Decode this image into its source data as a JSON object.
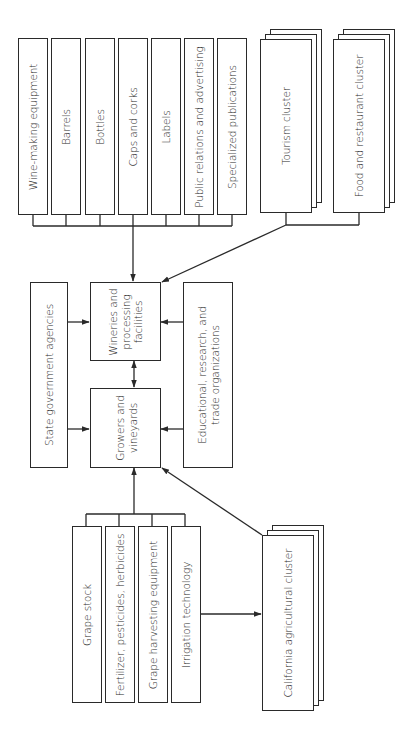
{
  "diagram": {
    "type": "cluster-map",
    "orientation": "rotated-90-ccw",
    "colors": {
      "stroke": "#2a2a2a",
      "background": "#ffffff",
      "text": "#2a2a2a"
    },
    "supplier_boxes_top": [
      {
        "id": "wine-making-equipment",
        "label": "Wine-making equipment"
      },
      {
        "id": "barrels",
        "label": "Barrels"
      },
      {
        "id": "bottles",
        "label": "Bottles"
      },
      {
        "id": "caps-and-corks",
        "label": "Caps and corks"
      },
      {
        "id": "labels",
        "label": "Labels"
      },
      {
        "id": "public-relations",
        "label": "Public relations and advertising"
      },
      {
        "id": "specialized-publications",
        "label": "Specialized publications"
      }
    ],
    "related_clusters_top": [
      {
        "id": "tourism-cluster",
        "label": "Tourism cluster"
      },
      {
        "id": "food-restaurant-cluster",
        "label": "Food and restaurant cluster"
      }
    ],
    "core": {
      "state_government": {
        "label": "State government agencies"
      },
      "wineries": {
        "line1": "Wineries and",
        "line2": "processing",
        "line3": "facilities"
      },
      "growers": {
        "line1": "Growers and",
        "line2": "vineyards"
      },
      "educational": {
        "line1": "Educational, research, and",
        "line2": "trade organizations"
      }
    },
    "supplier_boxes_bottom": [
      {
        "id": "grape-stock",
        "label": "Grape stock"
      },
      {
        "id": "fertilizer",
        "label": "Fertilizer, pesticides, herbicides"
      },
      {
        "id": "grape-harvesting",
        "label": "Grape harvesting equipment"
      },
      {
        "id": "irrigation",
        "label": "Irrigation technology"
      }
    ],
    "related_clusters_bottom": [
      {
        "id": "california-agricultural-cluster",
        "label": "California agricultural cluster"
      }
    ],
    "connections": [
      {
        "from": "top suppliers",
        "to": "Wineries and processing facilities",
        "type": "arrow"
      },
      {
        "from": "Tourism / Food and restaurant clusters",
        "to": "Wineries and processing facilities",
        "type": "arrow"
      },
      {
        "from": "State government agencies",
        "to": "Wineries and processing facilities",
        "type": "arrow"
      },
      {
        "from": "State government agencies",
        "to": "Growers and vineyards",
        "type": "arrow"
      },
      {
        "from": "Educational, research, and trade organizations",
        "to": "Wineries and processing facilities",
        "type": "arrow"
      },
      {
        "from": "Educational, research, and trade organizations",
        "to": "Growers and vineyards",
        "type": "arrow"
      },
      {
        "from": "Wineries and processing facilities",
        "to": "Growers and vineyards",
        "type": "bidirectional"
      },
      {
        "from": "bottom suppliers",
        "to": "Growers and vineyards",
        "type": "arrow"
      },
      {
        "from": "California agricultural cluster",
        "to": "Growers and vineyards",
        "type": "arrow"
      },
      {
        "from": "Irrigation technology",
        "to": "California agricultural cluster",
        "type": "arrow"
      }
    ]
  }
}
